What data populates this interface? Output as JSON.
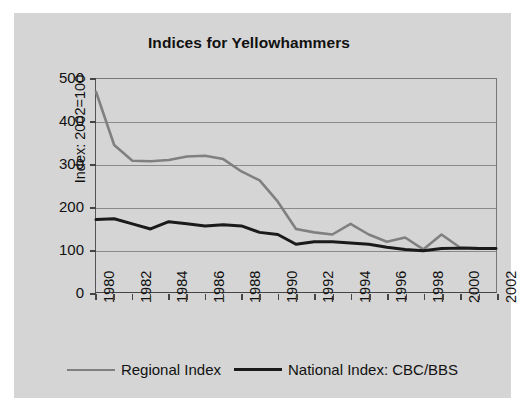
{
  "figure": {
    "background_color": "#d5d5d5",
    "title": "Indices for Yellowhammers"
  },
  "legend": {
    "position": "bottom-center",
    "entries": [
      {
        "label": "Regional Index",
        "color": "#808080",
        "line_width": 2.6
      },
      {
        "label": "National Index: CBC/BBS",
        "color": "#1a1a1a",
        "line_width": 3.0
      }
    ]
  },
  "chart_data": {
    "type": "line",
    "title": "Indices for Yellowhammers",
    "xlabel": "",
    "ylabel": "Index: 2002=100",
    "xlim": [
      1980,
      2002
    ],
    "ylim": [
      0,
      500
    ],
    "yticks": [
      0,
      100,
      200,
      300,
      400,
      500
    ],
    "ytick_labels": [
      "0",
      "100",
      "200",
      "300",
      "400",
      "500"
    ],
    "xticks": [
      1980,
      1981,
      1982,
      1983,
      1984,
      1985,
      1986,
      1987,
      1988,
      1989,
      1990,
      1991,
      1992,
      1993,
      1994,
      1995,
      1996,
      1997,
      1998,
      1999,
      2000,
      2001,
      2002
    ],
    "xtick_labels_shown": [
      "1980",
      "1982",
      "1984",
      "1986",
      "1988",
      "1990",
      "1992",
      "1994",
      "1996",
      "1998",
      "2000",
      "2002"
    ],
    "xtick_label_rotation": -90,
    "grid": "horizontal",
    "x": [
      1980,
      1981,
      1982,
      1983,
      1984,
      1985,
      1986,
      1987,
      1988,
      1989,
      1990,
      1991,
      1992,
      1993,
      1994,
      1995,
      1996,
      1997,
      1998,
      1999,
      2000,
      2001,
      2002
    ],
    "series": [
      {
        "name": "Regional Index",
        "color": "#808080",
        "values": [
          470,
          345,
          308,
          307,
          310,
          318,
          320,
          312,
          283,
          262,
          212,
          148,
          140,
          135,
          160,
          135,
          118,
          128,
          100,
          135,
          105,
          103,
          102
        ]
      },
      {
        "name": "National Index: CBC/BBS",
        "color": "#1a1a1a",
        "values": [
          170,
          172,
          160,
          148,
          165,
          160,
          155,
          158,
          155,
          140,
          135,
          112,
          118,
          118,
          115,
          112,
          105,
          100,
          97,
          102,
          103,
          102,
          102
        ]
      }
    ]
  }
}
